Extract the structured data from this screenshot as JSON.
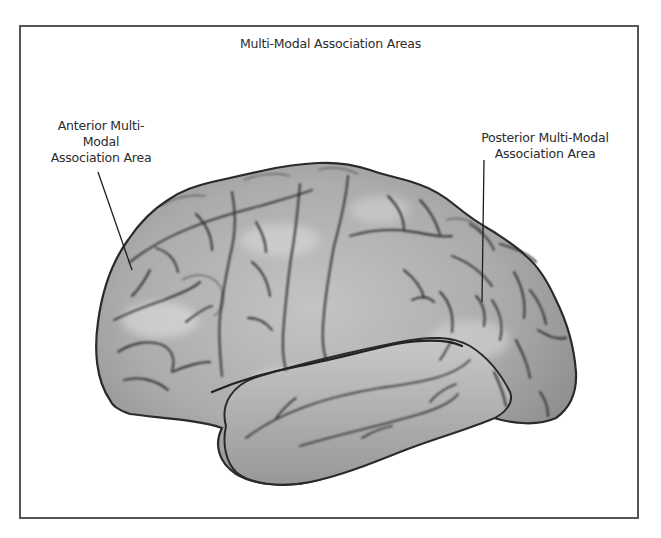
{
  "figure": {
    "title": "Multi-Modal Association Areas",
    "labels": [
      {
        "id": "anterior",
        "lines": [
          "Anterior Multi-",
          "Modal",
          "Association Area"
        ],
        "text": "Anterior Multi-Modal Association Area",
        "points_to": "frontal lobe (prefrontal region)"
      },
      {
        "id": "posterior",
        "lines": [
          "Posterior Multi-Modal",
          "Association Area"
        ],
        "text": "Posterior Multi-Modal Association Area",
        "points_to": "parietal-temporal-occipital junction"
      }
    ],
    "colors": {
      "frame": "#555555",
      "brain_fill": "#a9a9a9",
      "brain_highlight": "#d2d2d2",
      "sulcus": "#2e2e2e",
      "text": "#2b2b2b"
    }
  }
}
